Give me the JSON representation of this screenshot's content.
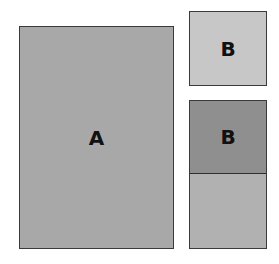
{
  "diagram": {
    "boxes": [
      {
        "id": "A",
        "label": "A",
        "color": "#a8a8a8"
      },
      {
        "id": "B-top",
        "label": "B",
        "color": "#c7c7c7"
      },
      {
        "id": "B-stacked",
        "label": "B",
        "color": "#8f8f8f"
      },
      {
        "id": "remainder",
        "label": "",
        "color": "#b1b1b1"
      }
    ]
  }
}
